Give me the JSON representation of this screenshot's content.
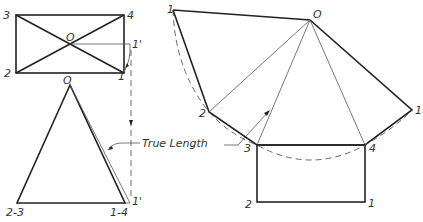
{
  "figure": {
    "annotation": "True Length",
    "colors": {
      "line": "#222222",
      "background": "#ffffff"
    }
  },
  "top_view": {
    "labels": {
      "c3": "3",
      "c4": "4",
      "c2": "2",
      "c1": "1",
      "apex": "O",
      "rotated": "1'"
    }
  },
  "front_view": {
    "labels": {
      "apex": "O",
      "left": "2-3",
      "right": "1-4",
      "rotated": "1'"
    }
  },
  "development": {
    "labels": {
      "apex": "O",
      "p1_left": "1",
      "p2": "2",
      "p3": "3",
      "p4": "4",
      "p1_right": "1",
      "base2": "2",
      "base1": "1"
    }
  }
}
